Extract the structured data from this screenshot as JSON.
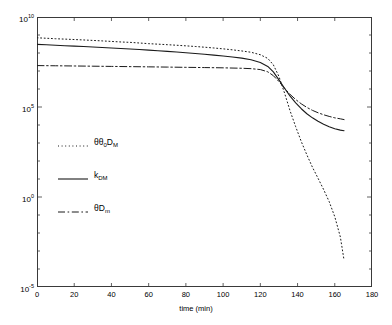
{
  "chart_data": {
    "type": "line",
    "title": "",
    "xlabel": "time (min)",
    "ylabel": "",
    "xlim": [
      0,
      180
    ],
    "ylim": [
      1e-05,
      10000000000.0
    ],
    "yscale": "log",
    "grid": false,
    "legend_position": "center-left",
    "xticks": [
      0,
      20,
      40,
      60,
      80,
      100,
      120,
      140,
      160,
      180
    ],
    "xtick_labels": [
      "0",
      "20",
      "40",
      "60",
      "80",
      "100",
      "120",
      "140",
      "160",
      "180"
    ],
    "ytick_exponents": [
      10,
      5,
      0,
      -5
    ],
    "ytick_labels": [
      "10",
      "10",
      "10",
      "10"
    ],
    "ytick_sup": [
      "10",
      "5",
      "0",
      "-5"
    ],
    "series": [
      {
        "name": "theta-theta0-DM",
        "label": "θθ",
        "label_sub": "0",
        "label_tail": "D",
        "label_tail_sub": "M",
        "style": "dotted",
        "color": "#1a1a1a",
        "x": [
          0,
          5,
          10,
          15,
          20,
          25,
          30,
          35,
          40,
          45,
          50,
          55,
          60,
          65,
          70,
          75,
          80,
          85,
          90,
          95,
          100,
          105,
          110,
          115,
          120,
          124,
          127,
          130,
          133,
          136,
          139,
          142,
          145,
          148,
          151,
          154,
          157,
          160,
          163,
          165
        ],
        "y": [
          700000000.0,
          660000000.0,
          620000000.0,
          590000000.0,
          560000000.0,
          530000000.0,
          500000000.0,
          470000000.0,
          440000000.0,
          410000000.0,
          390000000.0,
          360000000.0,
          330000000.0,
          310000000.0,
          290000000.0,
          270000000.0,
          250000000.0,
          230000000.0,
          210000000.0,
          190000000.0,
          170000000.0,
          150000000.0,
          130000000.0,
          110000000.0,
          80000000.0,
          50000000.0,
          22000000.0,
          5000000.0,
          600000.0,
          60000.0,
          8000.0,
          1200.0,
          220.0,
          45.0,
          11.0,
          2.6,
          0.55,
          0.08,
          0.006,
          0.0003
        ]
      },
      {
        "name": "k-DM",
        "label": "k",
        "label_sub": "DM",
        "style": "solid",
        "color": "#1a1a1a",
        "x": [
          0,
          5,
          10,
          15,
          20,
          25,
          30,
          35,
          40,
          45,
          50,
          55,
          60,
          65,
          70,
          75,
          80,
          85,
          90,
          95,
          100,
          105,
          110,
          115,
          120,
          124,
          127,
          130,
          133,
          136,
          139,
          142,
          145,
          148,
          151,
          154,
          157,
          160,
          163,
          165
        ],
        "y": [
          300000000.0,
          285000000.0,
          270000000.0,
          255000000.0,
          240000000.0,
          228000000.0,
          215000000.0,
          202000000.0,
          190000000.0,
          178000000.0,
          166000000.0,
          155000000.0,
          144000000.0,
          133000000.0,
          123000000.0,
          113000000.0,
          103000000.0,
          94000000.0,
          85000000.0,
          76000000.0,
          68000000.0,
          60000000.0,
          52000000.0,
          42000000.0,
          30000000.0,
          18000000.0,
          9000000.0,
          3200000.0,
          1100000.0,
          400000.0,
          170000.0,
          80000.0,
          42000.0,
          25000.0,
          16000.0,
          11000.0,
          8000.0,
          6200.0,
          5200.0,
          4800.0
        ]
      },
      {
        "name": "theta-Dm",
        "label": "θD",
        "label_sub": "m",
        "style": "dashdot",
        "color": "#1a1a1a",
        "x": [
          0,
          10,
          20,
          30,
          40,
          50,
          60,
          70,
          80,
          90,
          100,
          110,
          115,
          120,
          124,
          127,
          130,
          133,
          136,
          139,
          142,
          145,
          148,
          151,
          154,
          157,
          160,
          163,
          165
        ],
        "y": [
          20000000.0,
          19500000.0,
          19000000.0,
          18500000.0,
          18000000.0,
          17500000.0,
          17000000.0,
          16500000.0,
          16000000.0,
          15500000.0,
          15000000.0,
          14200000.0,
          13500000.0,
          12000000.0,
          9000000.0,
          5500000.0,
          2600000.0,
          1100000.0,
          500000.0,
          260000.0,
          150000.0,
          95000.0,
          65000.0,
          48000.0,
          37000.0,
          30000.0,
          25000.0,
          22000.0,
          20000.0
        ]
      }
    ]
  }
}
